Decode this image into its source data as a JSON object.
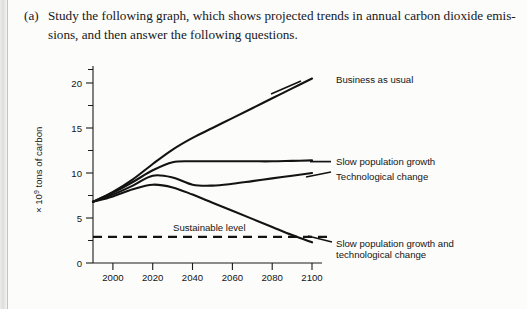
{
  "page": {
    "question_label": "(a)",
    "question_text_line1": "Study the following graph, which shows projected trends in annual carbon dioxide emis-",
    "question_text_line2": "sions, and then answer the following questions.",
    "partial_next_line": "(b)   In describing經 a curve"
  },
  "chart_data": {
    "type": "line",
    "title": "",
    "xlabel": "",
    "ylabel": "× 10⁹ tons of carbon",
    "xlim": [
      1990,
      2105
    ],
    "ylim": [
      0,
      22
    ],
    "xticks": [
      2000,
      2020,
      2040,
      2060,
      2080,
      2100
    ],
    "yticks": [
      0,
      5,
      10,
      15,
      20
    ],
    "yticks_minor": [
      2.5,
      7.5,
      12.5,
      17.5,
      21.5
    ],
    "grid": false,
    "legend": "inline-labels-right",
    "reference_line": {
      "label": "Sustainable level",
      "value": 2.9,
      "style": "dashed"
    },
    "series": [
      {
        "name": "Business as usual",
        "x": [
          1990,
          2000,
          2010,
          2020,
          2030,
          2040,
          2050,
          2060,
          2070,
          2080,
          2090,
          2100
        ],
        "values": [
          6.8,
          7.9,
          9.3,
          11.0,
          12.6,
          13.9,
          15.0,
          16.1,
          17.2,
          18.3,
          19.4,
          20.5
        ]
      },
      {
        "name": "Slow population growth",
        "x": [
          1990,
          2000,
          2010,
          2020,
          2030,
          2040,
          2050,
          2060,
          2070,
          2080,
          2090,
          2100
        ],
        "values": [
          6.8,
          7.8,
          9.0,
          10.3,
          11.2,
          11.3,
          11.3,
          11.3,
          11.3,
          11.3,
          11.35,
          11.4
        ]
      },
      {
        "name": "Technological change",
        "x": [
          1990,
          2000,
          2010,
          2020,
          2030,
          2040,
          2050,
          2060,
          2070,
          2080,
          2090,
          2100
        ],
        "values": [
          6.8,
          7.6,
          8.6,
          9.7,
          9.5,
          8.7,
          8.6,
          8.8,
          9.1,
          9.4,
          9.7,
          10.0
        ]
      },
      {
        "name": "Slow population growth and technological change",
        "x": [
          1990,
          2000,
          2010,
          2020,
          2030,
          2040,
          2050,
          2060,
          2070,
          2080,
          2090,
          2100
        ],
        "values": [
          6.8,
          7.4,
          8.2,
          8.7,
          8.4,
          7.6,
          6.7,
          5.8,
          4.9,
          4.0,
          3.1,
          2.3
        ]
      }
    ],
    "annotations": [
      {
        "text": "Business as usual",
        "x": 2073,
        "y": 20.2
      },
      {
        "text": "Slow population growth",
        "x": 2105,
        "y": 11.5
      },
      {
        "text": "Technological change",
        "x": 2105,
        "y": 9.9
      },
      {
        "text": "Slow population growth and",
        "x": 2108,
        "y": 3.4
      },
      {
        "text": "technological change",
        "x": 2108,
        "y": 2.2
      },
      {
        "text": "Sustainable level",
        "x": 2037,
        "y": 4.0
      }
    ]
  }
}
